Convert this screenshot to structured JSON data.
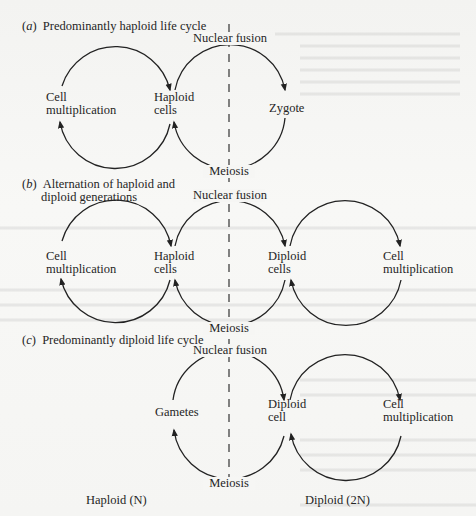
{
  "figure": {
    "panels": [
      {
        "id": "a",
        "marker": "a",
        "title_lines": [
          "Predominantly haploid life cycle"
        ],
        "top_label": "Nuclear fusion",
        "bottom_label": "Meiosis",
        "nodes": [
          {
            "lines": [
              "Cell",
              "multiplication"
            ]
          },
          {
            "lines": [
              "Haploid",
              "cells"
            ]
          },
          {
            "lines": [
              "Zygote"
            ]
          }
        ]
      },
      {
        "id": "b",
        "marker": "b",
        "title_lines": [
          "Alternation of haploid and",
          "diploid generations"
        ],
        "top_label": "Nuclear fusion",
        "bottom_label": "Meiosis",
        "nodes": [
          {
            "lines": [
              "Cell",
              "multiplication"
            ]
          },
          {
            "lines": [
              "Haploid",
              "cells"
            ]
          },
          {
            "lines": [
              "Diploid",
              "cells"
            ]
          },
          {
            "lines": [
              "Cell",
              "multiplication"
            ]
          }
        ]
      },
      {
        "id": "c",
        "marker": "c",
        "title_lines": [
          "Predominantly diploid life cycle"
        ],
        "top_label": "Nuclear fusion",
        "bottom_label": "Meiosis",
        "nodes": [
          {
            "lines": [
              "Gametes"
            ]
          },
          {
            "lines": [
              "Diploid",
              "cell"
            ]
          },
          {
            "lines": [
              "Cell",
              "multiplication"
            ]
          }
        ]
      }
    ],
    "footer": {
      "left": "Haploid (N)",
      "right": "Diploid (2N)"
    }
  },
  "colors": {
    "ink": "#222222",
    "paper": "#f6f6f4"
  }
}
